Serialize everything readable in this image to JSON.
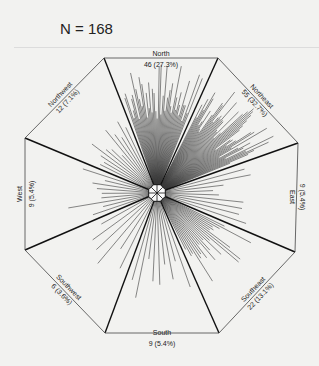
{
  "header": {
    "title": "N = 168"
  },
  "chart_data": {
    "type": "rose",
    "title": "N = 168",
    "total": 168,
    "categories": [
      "North",
      "Northeast",
      "East",
      "Southeast",
      "South",
      "Southwest",
      "West",
      "Northwest"
    ],
    "values": [
      46,
      55,
      9,
      22,
      9,
      6,
      9,
      12
    ],
    "percents": [
      "27.3%",
      "32.7%",
      "5.4%",
      "13.1%",
      "5.4%",
      "3.6%",
      "5.4%",
      "7.1%"
    ],
    "labels": [
      {
        "name": "North",
        "value": "46 (27.3%)"
      },
      {
        "name": "Northeast",
        "value": "55 (32.7%)"
      },
      {
        "name": "East",
        "value": "9 (5.4%)"
      },
      {
        "name": "Southeast",
        "value": "22 (13.1%)"
      },
      {
        "name": "South",
        "value": "9 (5.4%)"
      },
      {
        "name": "Southwest",
        "value": "6 (3.6%)"
      },
      {
        "name": "West",
        "value": "9 (5.4%)"
      },
      {
        "name": "Northwest",
        "value": "12 (7.1%)"
      }
    ],
    "colors": {
      "rays": "#3a3a3a",
      "sector_lines": "#111111",
      "dimension_lines": "#444444",
      "background": "#f2f2f0"
    }
  }
}
